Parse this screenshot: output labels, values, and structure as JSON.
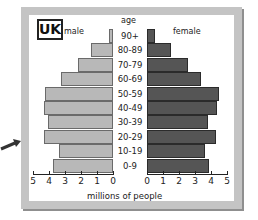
{
  "chart_data": {
    "type": "bar",
    "subtype": "population-pyramid",
    "title": "UK",
    "xlabel": "millions of people",
    "ylabel": "age",
    "categories": [
      "90+",
      "80-89",
      "70-79",
      "60-69",
      "50-59",
      "40-49",
      "30-39",
      "20-29",
      "10-19",
      "0-9"
    ],
    "series": [
      {
        "name": "male",
        "color": "#b8b8b8",
        "values": [
          0.25,
          1.4,
          2.2,
          3.25,
          4.25,
          4.3,
          4.05,
          4.3,
          3.4,
          3.75
        ]
      },
      {
        "name": "female",
        "color": "#555555",
        "values": [
          0.5,
          1.5,
          2.55,
          3.4,
          4.5,
          4.4,
          3.8,
          4.3,
          3.6,
          3.9
        ]
      }
    ],
    "x_ticks_left": [
      "5",
      "4",
      "3",
      "2",
      "1",
      "0"
    ],
    "x_ticks_right": [
      "0",
      "1",
      "2",
      "3",
      "4",
      "5"
    ],
    "xlim": [
      0,
      5
    ],
    "grid": false
  },
  "labels": {
    "title": "UK",
    "male": "male",
    "female": "female",
    "age": "age",
    "xlabel": "millions of people"
  }
}
